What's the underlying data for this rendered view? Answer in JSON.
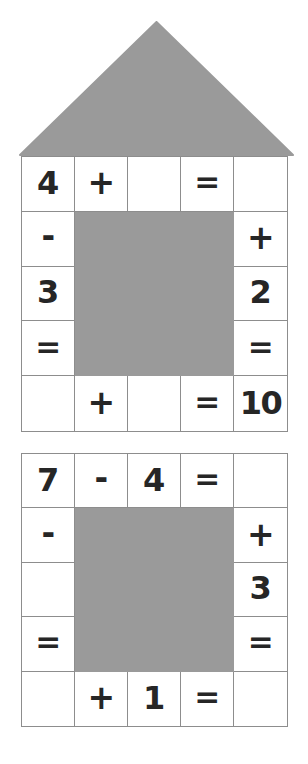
{
  "page": {
    "background_color": "#ffffff",
    "grid_line_color": "#8d8d8d",
    "gray_color": "#9a9a9a",
    "text_color": "#262626"
  },
  "roof": {
    "shape": "triangle",
    "fill": "#9a9a9a",
    "name": "house-roof"
  },
  "puzzles": [
    {
      "id": "puzzle-1",
      "has_roof": true,
      "rows": [
        [
          "4",
          "+",
          "",
          "=",
          ""
        ],
        [
          "-",
          "",
          "",
          "",
          "+"
        ],
        [
          "3",
          "",
          "",
          "",
          "2"
        ],
        [
          "=",
          "",
          "",
          "",
          "="
        ],
        [
          "",
          "+",
          "",
          "=",
          "10"
        ]
      ],
      "blocked_cells": [
        [
          1,
          1
        ],
        [
          1,
          2
        ],
        [
          1,
          3
        ],
        [
          2,
          1
        ],
        [
          2,
          2
        ],
        [
          2,
          3
        ],
        [
          3,
          1
        ],
        [
          3,
          2
        ],
        [
          3,
          3
        ]
      ]
    },
    {
      "id": "puzzle-2",
      "has_roof": false,
      "rows": [
        [
          "7",
          "-",
          "4",
          "=",
          ""
        ],
        [
          "-",
          "",
          "",
          "",
          "+"
        ],
        [
          "",
          "",
          "",
          "",
          "3"
        ],
        [
          "=",
          "",
          "",
          "",
          "="
        ],
        [
          "",
          "+",
          "1",
          "=",
          ""
        ]
      ],
      "blocked_cells": [
        [
          1,
          1
        ],
        [
          1,
          2
        ],
        [
          1,
          3
        ],
        [
          2,
          1
        ],
        [
          2,
          2
        ],
        [
          2,
          3
        ],
        [
          3,
          1
        ],
        [
          3,
          2
        ],
        [
          3,
          3
        ]
      ]
    }
  ]
}
